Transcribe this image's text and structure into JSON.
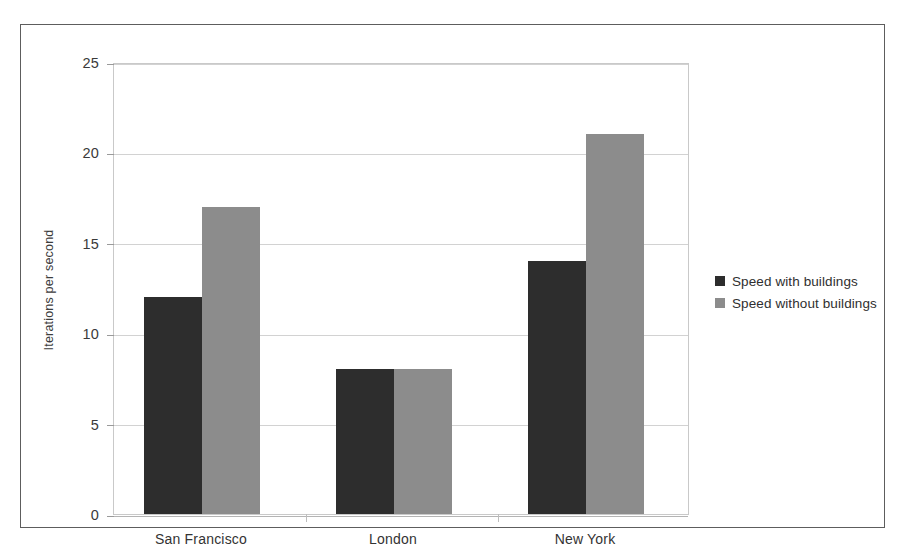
{
  "chart_data": {
    "type": "bar",
    "title": "",
    "subtitle": "",
    "xlabel": "",
    "ylabel": "Iterations per second",
    "categories": [
      "San Francisco",
      "London",
      "New York"
    ],
    "series": [
      {
        "name": "Speed with buildings",
        "color": "#2d2d2d",
        "values": [
          12,
          8,
          14
        ]
      },
      {
        "name": "Speed without buildings",
        "color": "#8c8c8c",
        "values": [
          17,
          8,
          21
        ]
      }
    ],
    "ylim": [
      0,
      25
    ],
    "yticks": [
      0,
      5,
      10,
      15,
      20,
      25
    ],
    "ytick_labels": [
      "0",
      "5",
      "10",
      "15",
      "20",
      "25"
    ],
    "grid": true,
    "grid_axis": "y",
    "legend_position": "right"
  },
  "frame": {
    "border_color": "#5d5d5d",
    "background": "#ffffff"
  },
  "plot": {
    "border_color": "#c9c9c9",
    "gridline_color": "#d2d2d2"
  }
}
